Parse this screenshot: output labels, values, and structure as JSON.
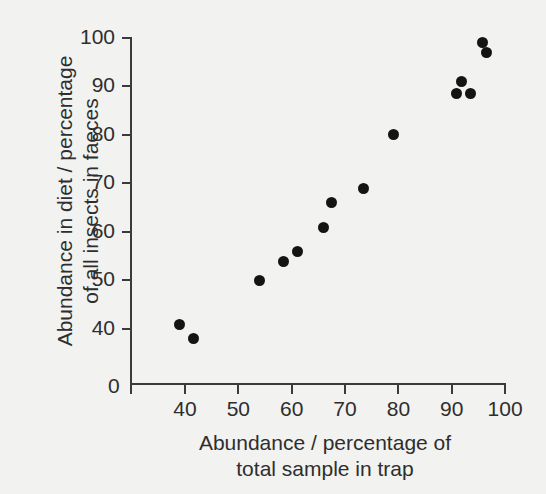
{
  "chart_data": {
    "type": "scatter",
    "title": "",
    "xlabel": "Abundance / percentage of total sample in trap",
    "ylabel": "Abundance in diet / percentage of all insects in faeces",
    "xlabel_lines": [
      "Abundance / percentage of",
      "total sample in trap"
    ],
    "ylabel_lines": [
      "Abundance in diet / percentage",
      "of all insects in faeces"
    ],
    "xlim": [
      33,
      101
    ],
    "ylim": [
      33,
      101
    ],
    "x_ticks": [
      40,
      50,
      60,
      70,
      80,
      90,
      100
    ],
    "y_ticks": [
      40,
      50,
      60,
      70,
      80,
      90,
      100
    ],
    "x_origin_label": "0",
    "y_origin_label": "0",
    "grid": false,
    "legend": false,
    "marker": "filled-circle",
    "marker_color": "#141414",
    "axis_color": "#3b3b3b",
    "background_color": "#f2f2f0",
    "points": [
      {
        "x": 39,
        "y": 41
      },
      {
        "x": 41.5,
        "y": 38
      },
      {
        "x": 54,
        "y": 50
      },
      {
        "x": 58.5,
        "y": 54
      },
      {
        "x": 61,
        "y": 56
      },
      {
        "x": 66,
        "y": 61
      },
      {
        "x": 67.5,
        "y": 66
      },
      {
        "x": 73.5,
        "y": 69
      },
      {
        "x": 79,
        "y": 80
      },
      {
        "x": 90.8,
        "y": 88.5
      },
      {
        "x": 91.8,
        "y": 91
      },
      {
        "x": 93.5,
        "y": 88.5
      },
      {
        "x": 95.8,
        "y": 99
      },
      {
        "x": 96.5,
        "y": 97
      }
    ]
  },
  "bleed_through": {
    "lines": [
      {
        "text": "of sample a possible e-benchmark that is",
        "top": 4,
        "right": 534
      },
      {
        "text": "identified DNA sequence",
        "top": 24,
        "right": 500
      },
      {
        "text": "per the pools rec. from a chemical and",
        "top": 52,
        "right": 526
      },
      {
        "text": "the analyses of branches of arthropod",
        "top": 76,
        "right": 514
      },
      {
        "text": "Suppose that the plant's the situation in",
        "top": 100,
        "right": 520
      },
      {
        "text": "the web pool of a sample",
        "top": 124,
        "right": 482
      }
    ]
  }
}
